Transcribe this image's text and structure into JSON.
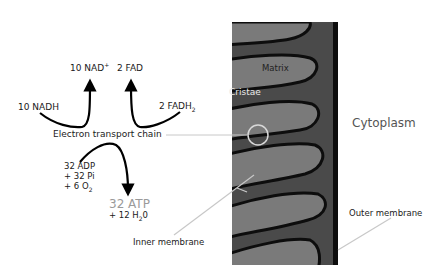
{
  "diagram": {
    "colors": {
      "intermembrane_space": "#4a4a4a",
      "matrix_fill": "#7a7a7a",
      "membrane": "#0d0d0d",
      "leader_line": "#c8c8c8",
      "atp_text": "#9a9a9a",
      "cytoplasm_text": "#555555",
      "cristae_text": "#e8e8e8"
    },
    "reactants_products": {
      "nad_plus": {
        "num": "10 NAD",
        "sup": "+"
      },
      "fad": "2 FAD",
      "nadh": "10 NADH",
      "fadh2": {
        "base": "2 FADH",
        "sub": "2"
      },
      "etc_label": "Electron transport chain",
      "inputs": {
        "line1": "32 ADP",
        "line2": "+ 32 Pi",
        "line3_base": "+ 6 O",
        "line3_sub": "2"
      },
      "outputs": {
        "atp": "32 ATP",
        "water_base": "+ 12 H",
        "water_sub": "2",
        "water_end": "0"
      }
    },
    "mitochondrion_labels": {
      "matrix": "Matrix",
      "cristae": "Cristae",
      "cytoplasm": "Cytoplasm",
      "inner_membrane": "Inner membrane",
      "outer_membrane": "Outer membrane"
    }
  }
}
